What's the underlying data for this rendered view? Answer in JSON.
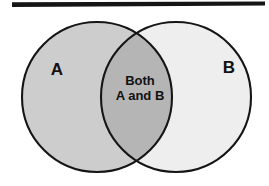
{
  "figure": {
    "type": "venn-diagram",
    "background_color": "#ffffff",
    "width": 269,
    "height": 186
  },
  "top_rule": {
    "name": "horizontal-rule",
    "color": "#151515",
    "x_start": 12,
    "x_end": 265,
    "y": 6,
    "thickness": 4
  },
  "sets": [
    {
      "id": "set-a",
      "label": "A",
      "fill_color": "#cdcdcd",
      "stroke_color": "#151515",
      "center_x": 97,
      "center_y": 97,
      "radius": 75,
      "label_x": 57,
      "label_y": 75
    },
    {
      "id": "set-b",
      "label": "B",
      "fill_color": "#eeeeee",
      "stroke_color": "#151515",
      "center_x": 176,
      "center_y": 97,
      "radius": 75,
      "label_x": 229,
      "label_y": 73
    }
  ],
  "intersection": {
    "id": "intersection-ab",
    "fill_color": "#b5b5b5",
    "label_line_1": "Both",
    "label_line_2": "A and B",
    "label_x": 140,
    "label_y_1": 85,
    "label_y_2": 100
  }
}
